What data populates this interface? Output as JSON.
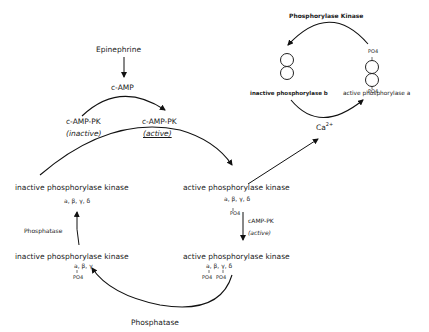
{
  "diagram": {
    "title": "",
    "nodes": {
      "epinephrine": "Epinephrine",
      "camp": "c-AMP",
      "camp_pk_inactive": {
        "name": "c-AMP-PK",
        "state": "(inactive)"
      },
      "camp_pk_active": {
        "name": "c-AMP-PK",
        "state": "(active)"
      },
      "inactive_phk_top": {
        "name": "inactive phosphorylase kinase",
        "subunits": "a, β, γ, δ"
      },
      "active_phk_mid": {
        "name": "active phosphorylase kinase",
        "subunits": "a, β, γ, δ",
        "phospho": "PO4"
      },
      "camp_pk_active_2": {
        "name": "cAMP-PK",
        "state": "(active)"
      },
      "inactive_phk_bottom": {
        "name": "inactive phosphorylase kinase",
        "subunits": "a, β, γ",
        "phospho": "PO4"
      },
      "active_phk_bottom": {
        "name": "active phosphorylase kinase",
        "subunits": "a, β, γ, δ",
        "phospho_a": "PO4",
        "phospho_b": "PO4"
      },
      "phosphatase_left": "Phosphatase",
      "phosphatase_bottom": "Phosphatase",
      "phosphorylase_kinase": "Phosphorylase Kinase",
      "inactive_phosphorylase_b": "inactive phosphorylase b",
      "active_phosphorylase_a": "active phosphorylase a",
      "po4_top": "PO4",
      "po4_bottom": "PO4",
      "calcium": "Ca",
      "calcium_charge": "2+"
    },
    "edges": [
      {
        "from": "Epinephrine",
        "to": "c-AMP"
      },
      {
        "from": "c-AMP-PK (inactive)",
        "to": "c-AMP-PK (active)",
        "via": "c-AMP"
      },
      {
        "from": "c-AMP-PK (active)",
        "to": "active phosphorylase kinase",
        "origin": "inactive phosphorylase kinase"
      },
      {
        "from": "active phosphorylase kinase",
        "to": "Ca2+"
      },
      {
        "from": "active phosphorylase kinase",
        "to": "active phosphorylase kinase (diphospho)",
        "via": "cAMP-PK (active)"
      },
      {
        "from": "active phosphorylase kinase (diphospho)",
        "to": "inactive phosphorylase kinase (PO4)",
        "via": "Phosphatase"
      },
      {
        "from": "inactive phosphorylase kinase (PO4)",
        "to": "inactive phosphorylase kinase",
        "via": "Phosphatase"
      },
      {
        "from": "active phosphorylase a",
        "to": "inactive phosphorylase b",
        "via": "Phosphorylase Kinase"
      },
      {
        "from": "inactive phosphorylase b",
        "to": "active phosphorylase a",
        "via": "Ca2+"
      }
    ]
  }
}
